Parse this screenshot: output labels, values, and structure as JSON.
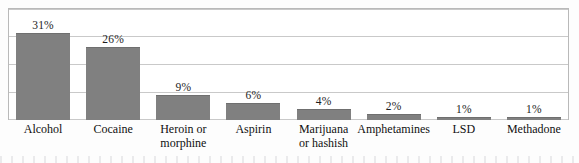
{
  "chart_data": {
    "type": "bar",
    "title": "",
    "subtitle": "",
    "xlabel": "",
    "ylabel": "",
    "ylim": [
      0,
      40
    ],
    "grid": true,
    "legend": "none",
    "orientation": "vertical",
    "value_suffix": "%",
    "categories": [
      "Alcohol",
      "Cocaine",
      "Heroin or\nmorphine",
      "Aspirin",
      "Marijuana\nor hashish",
      "Amphetamines",
      "LSD",
      "Methadone"
    ],
    "values": [
      31,
      26,
      9,
      6,
      4,
      2,
      1,
      1
    ],
    "value_labels": [
      "31%",
      "26%",
      "9%",
      "6%",
      "4%",
      "2%",
      "1%",
      "1%"
    ],
    "gridline_values": [
      40,
      30,
      20,
      10,
      0
    ],
    "bar_color": "#808080",
    "gridline_color": "#c9c9c9",
    "frame_color": "#b9b9b9",
    "background_color": "#ffffff",
    "text_color": "#101010"
  }
}
